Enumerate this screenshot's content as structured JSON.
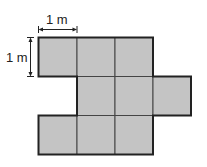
{
  "diagram": {
    "title": "",
    "labels": {
      "width_label": "1 m",
      "height_label": "1 m"
    },
    "grid": {
      "origin_x": 38,
      "origin_y": 37,
      "cell_size": 38.5,
      "cells": [
        {
          "row": 0,
          "col": 0
        },
        {
          "row": 0,
          "col": 1
        },
        {
          "row": 0,
          "col": 2
        },
        {
          "row": 1,
          "col": 1
        },
        {
          "row": 1,
          "col": 2
        },
        {
          "row": 1,
          "col": 3
        },
        {
          "row": 2,
          "col": 0
        },
        {
          "row": 2,
          "col": 1
        },
        {
          "row": 2,
          "col": 2
        }
      ],
      "cell_count": 9
    },
    "colors": {
      "fill": "#c4c4c4",
      "stroke": "#333333",
      "outline": "#222222"
    }
  }
}
